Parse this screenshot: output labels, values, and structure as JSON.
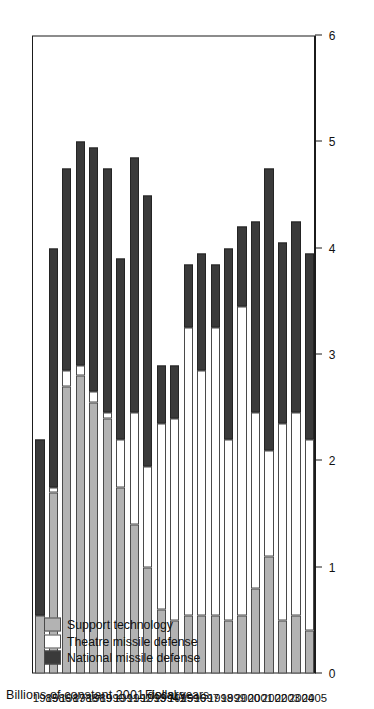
{
  "chart_data": {
    "type": "bar",
    "orientation": "vertical-stacked-rotated",
    "title": "",
    "xlabel": "Fiscal years",
    "ylabel": "Billions of constant 2001 dollars",
    "ylim": [
      0,
      6
    ],
    "yticks": [
      0,
      1,
      2,
      3,
      4,
      5,
      6
    ],
    "ytick_labels": [
      "0",
      "1",
      "2",
      "3",
      "4",
      "5",
      "6"
    ],
    "grid": false,
    "legend_position": "upper-left",
    "categories": [
      "1985",
      "1986",
      "1987",
      "1988",
      "1989",
      "1990",
      "1991",
      "1992",
      "1993",
      "1994",
      "1995",
      "1996",
      "1997",
      "1998",
      "1999",
      "2000",
      "2001",
      "2002",
      "2003",
      "2004",
      "2005"
    ],
    "series": [
      {
        "name": "National missile defense",
        "color": "#3a3a3a",
        "values": [
          1.65,
          2.25,
          1.9,
          2.1,
          2.3,
          2.3,
          1.7,
          2.4,
          2.55,
          0.55,
          0.5,
          0.6,
          1.1,
          0.6,
          1.8,
          0.75,
          1.8,
          2.65,
          1.7,
          1.8,
          1.75
        ]
      },
      {
        "name": "Theatre missile defense",
        "color": "#ffffff",
        "values": [
          0.0,
          0.05,
          0.15,
          0.1,
          0.1,
          0.05,
          0.45,
          1.05,
          0.95,
          1.75,
          1.9,
          2.7,
          2.3,
          2.7,
          1.7,
          2.9,
          1.65,
          1.0,
          1.85,
          1.9,
          1.8
        ]
      },
      {
        "name": "Support technology",
        "color": "#b3b3b3",
        "values": [
          0.55,
          1.7,
          2.7,
          2.8,
          2.55,
          2.4,
          1.75,
          1.4,
          1.0,
          0.6,
          0.5,
          0.55,
          0.55,
          0.55,
          0.5,
          0.55,
          0.8,
          1.1,
          0.5,
          0.55,
          0.4
        ]
      }
    ],
    "totals": [
      2.2,
      4.0,
      4.75,
      5.0,
      4.95,
      4.75,
      3.9,
      4.85,
      4.5,
      2.9,
      2.9,
      3.85,
      3.95,
      3.85,
      4.0,
      4.2,
      4.25,
      4.75,
      4.05,
      4.25,
      3.95
    ]
  },
  "axes": {
    "value_axis_title": "Billions of constant 2001 dollars",
    "category_axis_title": "Fiscal years",
    "value_ticks": [
      "0",
      "1",
      "2",
      "3",
      "4",
      "5",
      "6"
    ],
    "category_ticks": [
      "1985",
      "1986",
      "1987",
      "1988",
      "1989",
      "1990",
      "1991",
      "1992",
      "1993",
      "1994",
      "1995",
      "1996",
      "1997",
      "1998",
      "1999",
      "2000",
      "2001",
      "2002",
      "2003",
      "2004",
      "2005"
    ]
  },
  "legend": {
    "items": [
      {
        "label": "Support technology",
        "color": "#b3b3b3"
      },
      {
        "label": "Theatre missile defense",
        "color": "#ffffff"
      },
      {
        "label": "National missile defense",
        "color": "#3a3a3a"
      }
    ]
  },
  "colors": {
    "support_technology": "#b3b3b3",
    "theatre_missile_defense": "#ffffff",
    "national_missile_defense": "#3a3a3a",
    "axis": "#1b1b1b",
    "background": "#ffffff"
  }
}
